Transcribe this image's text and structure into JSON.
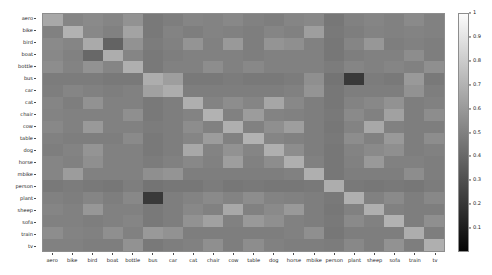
{
  "chart_data": {
    "type": "heatmap",
    "title": "",
    "xlabel": "",
    "ylabel": "",
    "colormap": "gray",
    "grid": false,
    "legend_position": "right",
    "colorbar": {
      "ticks": [
        "1",
        "0.9",
        "0.8",
        "0.7",
        "0.6",
        "0.5",
        "0.4",
        "0.3",
        "0.2",
        "0.1"
      ],
      "tick_values": [
        1.0,
        0.9,
        0.8,
        0.7,
        0.6,
        0.5,
        0.4,
        0.3,
        0.2,
        0.1
      ],
      "vmin": 0.0,
      "vmax": 1.0,
      "low_color": "#050505",
      "high_color": "#fcfcfc"
    },
    "x_categories": [
      "aero",
      "bike",
      "bird",
      "boat",
      "bottle",
      "bus",
      "car",
      "cat",
      "chair",
      "cow",
      "table",
      "dog",
      "horse",
      "mbike",
      "person",
      "plant",
      "sheep",
      "sofa",
      "train",
      "tv"
    ],
    "y_categories": [
      "aero",
      "bike",
      "bird",
      "boat",
      "bottle",
      "bus",
      "car",
      "cat",
      "chair",
      "cow",
      "table",
      "dog",
      "horse",
      "mbike",
      "person",
      "plant",
      "sheep",
      "sofa",
      "train",
      "tv"
    ],
    "values": [
      [
        0.66,
        0.52,
        0.54,
        0.52,
        0.57,
        0.47,
        0.49,
        0.52,
        0.51,
        0.53,
        0.5,
        0.49,
        0.52,
        0.53,
        0.46,
        0.5,
        0.52,
        0.5,
        0.54,
        0.5
      ],
      [
        0.5,
        0.7,
        0.53,
        0.5,
        0.64,
        0.47,
        0.51,
        0.49,
        0.51,
        0.5,
        0.49,
        0.52,
        0.5,
        0.62,
        0.47,
        0.49,
        0.51,
        0.5,
        0.51,
        0.5
      ],
      [
        0.54,
        0.52,
        0.67,
        0.38,
        0.57,
        0.48,
        0.5,
        0.58,
        0.5,
        0.6,
        0.49,
        0.58,
        0.56,
        0.5,
        0.46,
        0.52,
        0.59,
        0.49,
        0.5,
        0.49
      ],
      [
        0.53,
        0.5,
        0.4,
        0.68,
        0.52,
        0.47,
        0.49,
        0.5,
        0.5,
        0.5,
        0.49,
        0.5,
        0.5,
        0.5,
        0.46,
        0.49,
        0.5,
        0.5,
        0.55,
        0.49
      ],
      [
        0.55,
        0.51,
        0.57,
        0.52,
        0.69,
        0.47,
        0.5,
        0.5,
        0.55,
        0.5,
        0.53,
        0.5,
        0.5,
        0.5,
        0.48,
        0.52,
        0.5,
        0.52,
        0.5,
        0.56
      ],
      [
        0.48,
        0.48,
        0.48,
        0.47,
        0.47,
        0.68,
        0.62,
        0.47,
        0.47,
        0.48,
        0.47,
        0.47,
        0.48,
        0.56,
        0.45,
        0.21,
        0.48,
        0.47,
        0.6,
        0.47
      ],
      [
        0.49,
        0.52,
        0.5,
        0.49,
        0.5,
        0.63,
        0.68,
        0.49,
        0.49,
        0.49,
        0.49,
        0.49,
        0.5,
        0.58,
        0.46,
        0.49,
        0.49,
        0.49,
        0.57,
        0.49
      ],
      [
        0.52,
        0.49,
        0.57,
        0.5,
        0.5,
        0.47,
        0.49,
        0.69,
        0.51,
        0.55,
        0.52,
        0.65,
        0.53,
        0.49,
        0.46,
        0.51,
        0.53,
        0.57,
        0.49,
        0.5
      ],
      [
        0.51,
        0.5,
        0.5,
        0.5,
        0.56,
        0.47,
        0.49,
        0.51,
        0.7,
        0.5,
        0.61,
        0.51,
        0.5,
        0.49,
        0.47,
        0.54,
        0.5,
        0.63,
        0.49,
        0.55
      ],
      [
        0.53,
        0.5,
        0.6,
        0.5,
        0.5,
        0.48,
        0.49,
        0.55,
        0.5,
        0.69,
        0.5,
        0.56,
        0.62,
        0.49,
        0.46,
        0.51,
        0.66,
        0.5,
        0.49,
        0.49
      ],
      [
        0.5,
        0.49,
        0.49,
        0.49,
        0.54,
        0.47,
        0.49,
        0.52,
        0.61,
        0.5,
        0.7,
        0.52,
        0.5,
        0.49,
        0.47,
        0.55,
        0.5,
        0.6,
        0.49,
        0.55
      ],
      [
        0.49,
        0.51,
        0.58,
        0.5,
        0.5,
        0.47,
        0.49,
        0.66,
        0.51,
        0.57,
        0.52,
        0.69,
        0.55,
        0.49,
        0.46,
        0.51,
        0.54,
        0.56,
        0.49,
        0.5
      ],
      [
        0.52,
        0.5,
        0.56,
        0.5,
        0.5,
        0.48,
        0.5,
        0.53,
        0.5,
        0.62,
        0.5,
        0.55,
        0.69,
        0.5,
        0.46,
        0.5,
        0.6,
        0.5,
        0.5,
        0.49
      ],
      [
        0.52,
        0.61,
        0.5,
        0.5,
        0.5,
        0.56,
        0.58,
        0.49,
        0.49,
        0.49,
        0.49,
        0.49,
        0.5,
        0.69,
        0.46,
        0.49,
        0.49,
        0.49,
        0.55,
        0.49
      ],
      [
        0.47,
        0.48,
        0.47,
        0.46,
        0.49,
        0.45,
        0.46,
        0.46,
        0.48,
        0.46,
        0.47,
        0.46,
        0.46,
        0.47,
        0.68,
        0.47,
        0.46,
        0.47,
        0.46,
        0.48
      ],
      [
        0.5,
        0.49,
        0.52,
        0.49,
        0.53,
        0.21,
        0.49,
        0.51,
        0.54,
        0.51,
        0.55,
        0.51,
        0.5,
        0.49,
        0.47,
        0.69,
        0.5,
        0.54,
        0.49,
        0.53
      ],
      [
        0.52,
        0.5,
        0.59,
        0.5,
        0.5,
        0.47,
        0.49,
        0.53,
        0.5,
        0.66,
        0.5,
        0.54,
        0.6,
        0.49,
        0.46,
        0.5,
        0.69,
        0.5,
        0.49,
        0.49
      ],
      [
        0.5,
        0.5,
        0.49,
        0.5,
        0.52,
        0.47,
        0.49,
        0.57,
        0.63,
        0.5,
        0.6,
        0.56,
        0.5,
        0.49,
        0.47,
        0.54,
        0.5,
        0.7,
        0.49,
        0.56
      ],
      [
        0.55,
        0.51,
        0.5,
        0.56,
        0.5,
        0.6,
        0.57,
        0.49,
        0.49,
        0.49,
        0.49,
        0.49,
        0.5,
        0.56,
        0.46,
        0.49,
        0.49,
        0.49,
        0.68,
        0.49
      ],
      [
        0.5,
        0.5,
        0.49,
        0.49,
        0.57,
        0.47,
        0.49,
        0.5,
        0.56,
        0.49,
        0.55,
        0.5,
        0.49,
        0.49,
        0.48,
        0.53,
        0.49,
        0.57,
        0.49,
        0.69
      ]
    ]
  }
}
